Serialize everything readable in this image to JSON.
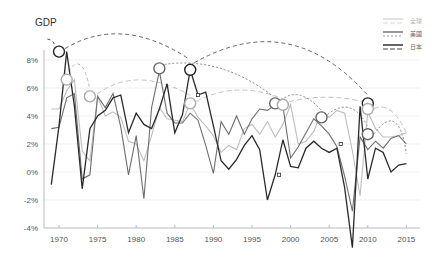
{
  "chart_data": {
    "type": "line",
    "title": "GDP",
    "xlabel": "",
    "ylabel": "GDP",
    "ylim": [
      -4,
      9
    ],
    "xlim": [
      1968,
      2016
    ],
    "y_ticks": [
      "8%",
      "6%",
      "4%",
      "2%",
      "0%",
      "-2%",
      "-4%"
    ],
    "x_ticks": [
      "1970",
      "1975",
      "1980",
      "1985",
      "1990",
      "1995",
      "2000",
      "2005",
      "2010",
      "2015"
    ],
    "legend": [
      {
        "label": "全球",
        "color": "#c8c8c8"
      },
      {
        "label": "美國",
        "color": "#555555"
      },
      {
        "label": "日本",
        "color": "#222222"
      }
    ],
    "legend_position": "top-right",
    "grid": true,
    "x": [
      1969,
      1970,
      1971,
      1972,
      1973,
      1974,
      1975,
      1976,
      1977,
      1978,
      1979,
      1980,
      1981,
      1982,
      1983,
      1984,
      1985,
      1986,
      1987,
      1988,
      1989,
      1990,
      1991,
      1992,
      1993,
      1994,
      1995,
      1996,
      1997,
      1998,
      1999,
      2000,
      2001,
      2002,
      2003,
      2004,
      2005,
      2006,
      2007,
      2008,
      2009,
      2010,
      2011,
      2012,
      2013,
      2014,
      2015
    ],
    "series": [
      {
        "name": "全球",
        "color": "#bdbdbd",
        "values": [
          4.5,
          4.5,
          5.8,
          6.6,
          1.5,
          0.8,
          5.4,
          4.0,
          4.3,
          3.9,
          2.2,
          2.0,
          0.8,
          2.6,
          4.6,
          3.8,
          3.7,
          3.6,
          4.9,
          3.9,
          3.3,
          2.6,
          1.4,
          1.9,
          1.6,
          3.1,
          3.4,
          2.7,
          3.6,
          2.5,
          3.4,
          4.8,
          2.0,
          2.2,
          2.9,
          4.3,
          3.9,
          4.4,
          4.2,
          1.5,
          -1.7,
          4.3,
          3.1,
          2.5,
          2.5,
          2.6,
          2.8
        ]
      },
      {
        "name": "美國",
        "color": "#6e6e6e",
        "values": [
          3.1,
          3.2,
          5.3,
          5.6,
          -0.5,
          -0.2,
          5.4,
          4.6,
          5.6,
          3.2,
          -0.2,
          2.6,
          -1.9,
          4.6,
          7.2,
          4.2,
          3.5,
          3.5,
          4.2,
          3.7,
          1.9,
          -0.1,
          3.6,
          2.7,
          4.0,
          2.7,
          3.8,
          4.5,
          4.4,
          4.8,
          4.7,
          1.0,
          1.8,
          2.8,
          3.8,
          3.3,
          2.7,
          1.8,
          -0.3,
          -2.8,
          2.5,
          1.6,
          2.2,
          1.7,
          2.4,
          2.6,
          2.0
        ]
      },
      {
        "name": "日本",
        "color": "#2a2a2a",
        "values": [
          -0.9,
          3.3,
          8.6,
          4.7,
          -1.2,
          3.1,
          4.0,
          4.4,
          5.3,
          5.5,
          2.8,
          4.2,
          3.4,
          3.1,
          4.5,
          6.3,
          2.8,
          4.1,
          7.3,
          5.5,
          5.7,
          3.3,
          0.8,
          0.2,
          0.9,
          1.9,
          2.6,
          1.6,
          -2.0,
          -0.2,
          2.3,
          0.4,
          0.3,
          1.7,
          2.2,
          1.7,
          1.4,
          1.7,
          -1.1,
          -5.4,
          4.7,
          -0.5,
          1.7,
          1.4,
          0.0,
          0.5,
          0.6
        ]
      }
    ],
    "annotations": {
      "circles": [
        {
          "year": 1970,
          "value": 8.6,
          "series": "日本"
        },
        {
          "year": 1971,
          "value": 6.6,
          "series": "全球"
        },
        {
          "year": 1974,
          "value": 5.4,
          "series": "全球"
        },
        {
          "year": 1983,
          "value": 7.4,
          "series": "美國"
        },
        {
          "year": 1987,
          "value": 7.3,
          "series": "日本"
        },
        {
          "year": 1987,
          "value": 4.9,
          "series": "全球"
        },
        {
          "year": 1998,
          "value": 4.9,
          "series": "美國"
        },
        {
          "year": 1999,
          "value": 4.8,
          "series": "全球"
        },
        {
          "year": 2004,
          "value": 3.9,
          "series": "美國"
        },
        {
          "year": 2010,
          "value": 4.9,
          "series": "日本"
        },
        {
          "year": 2010,
          "value": 4.5,
          "series": "全球"
        },
        {
          "year": 2010,
          "value": 2.7,
          "series": "美國"
        }
      ],
      "arrows": "dashed curved arrows connecting successive peaks"
    }
  },
  "legend_labels": {
    "world": "全球",
    "us": "美國",
    "japan": "日本"
  },
  "title": "GDP"
}
